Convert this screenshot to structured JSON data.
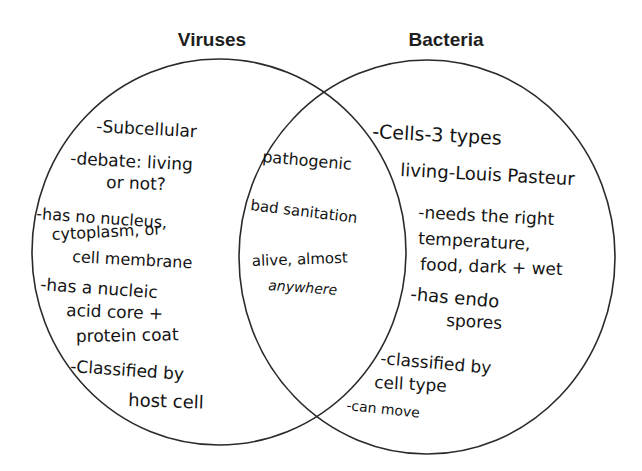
{
  "diagram": {
    "type": "venn",
    "colors": {
      "ink": "#141414",
      "outline": "#2a2a2a",
      "background": "#ffffff"
    },
    "left_set": {
      "title": "Viruses",
      "items": [
        {
          "lines": [
            "-Subcellular"
          ]
        },
        {
          "lines": [
            "-debate: living",
            "or not?"
          ]
        },
        {
          "lines": [
            "-has no nucleus,",
            "cytoplasm, or",
            "cell membrane"
          ]
        },
        {
          "lines": [
            "-has a nucleic",
            "acid core +",
            "protein coat"
          ]
        },
        {
          "lines": [
            "-Classified by",
            "host cell"
          ]
        }
      ]
    },
    "right_set": {
      "title": "Bacteria",
      "items": [
        {
          "lines": [
            "-Cells-3 types"
          ]
        },
        {
          "lines": [
            "living-Louis Pasteur"
          ]
        },
        {
          "lines": [
            "-needs the right",
            "temperature,",
            "food, dark + wet"
          ]
        },
        {
          "lines": [
            "-has endo",
            "spores"
          ]
        },
        {
          "lines": [
            "-classified by",
            "cell type"
          ]
        },
        {
          "lines": [
            "-can move"
          ]
        }
      ]
    },
    "overlap": {
      "items": [
        {
          "lines": [
            "pathogenic"
          ]
        },
        {
          "lines": [
            "bad sanitation"
          ]
        },
        {
          "lines": [
            "alive, almost",
            "anywhere"
          ]
        }
      ]
    }
  }
}
